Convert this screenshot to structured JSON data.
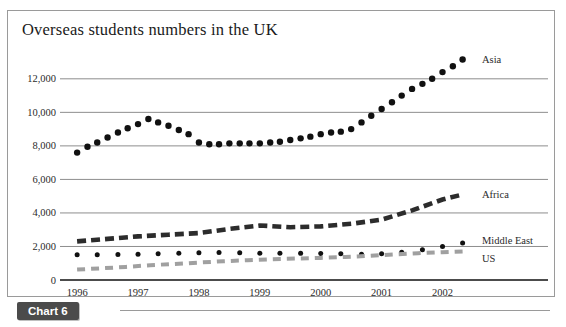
{
  "figure": {
    "title": "Overseas students numbers in the UK",
    "badge_label": "Chart 6"
  },
  "chart_data": {
    "type": "line",
    "title": "Overseas students numbers in the UK",
    "xlabel": "",
    "ylabel": "",
    "x": [
      1996,
      1997,
      1998,
      1999,
      2000,
      2001,
      2002
    ],
    "categories": [
      "1996",
      "1997",
      "1998",
      "1999",
      "2000",
      "2001",
      "2002"
    ],
    "xlim": [
      1995.85,
      2002.55
    ],
    "ylim": [
      0,
      13600
    ],
    "yticks": [
      0,
      2000,
      4000,
      6000,
      8000,
      10000,
      12000
    ],
    "ytick_labels": [
      "0",
      "2,000",
      "4,000",
      "6,000",
      "8,000",
      "10,000",
      "12,000"
    ],
    "grid": "horizontal",
    "legend": "right-inline",
    "series": [
      {
        "name": "Asia",
        "style": "dotted",
        "color": "#111111",
        "label": "Asia",
        "x": [
          1996.0,
          1996.17,
          1996.33,
          1996.5,
          1996.67,
          1996.83,
          1997.0,
          1997.17,
          1997.33,
          1997.5,
          1997.67,
          1997.83,
          1998.0,
          1998.17,
          1998.33,
          1998.5,
          1998.67,
          1998.83,
          1999.0,
          1999.17,
          1999.33,
          1999.5,
          1999.67,
          1999.83,
          2000.0,
          2000.17,
          2000.33,
          2000.5,
          2000.67,
          2000.83,
          2001.0,
          2001.17,
          2001.33,
          2001.5,
          2001.67,
          2001.83,
          2002.0,
          2002.17,
          2002.33
        ],
        "values": [
          7600,
          7950,
          8200,
          8500,
          8800,
          9050,
          9300,
          9600,
          9400,
          9200,
          8950,
          8700,
          8200,
          8100,
          8100,
          8150,
          8150,
          8150,
          8150,
          8200,
          8250,
          8350,
          8450,
          8550,
          8700,
          8800,
          8850,
          9000,
          9400,
          9800,
          10200,
          10600,
          11000,
          11400,
          11700,
          12000,
          12400,
          12750,
          13150
        ]
      },
      {
        "name": "Africa",
        "style": "dashed-thick",
        "color": "#2c2c2c",
        "label": "Africa",
        "x": [
          1996.0,
          1996.5,
          1997.0,
          1997.5,
          1998.0,
          1998.5,
          1999.0,
          1999.5,
          2000.0,
          2000.5,
          2001.0,
          2001.5,
          2002.0,
          2002.33
        ],
        "values": [
          2300,
          2450,
          2600,
          2700,
          2800,
          3050,
          3250,
          3150,
          3200,
          3350,
          3600,
          4150,
          4800,
          5100
        ]
      },
      {
        "name": "Middle East",
        "style": "dotted",
        "color": "#111111",
        "label": "Middle East",
        "x": [
          1996.0,
          1996.33,
          1996.67,
          1997.0,
          1997.33,
          1997.67,
          1998.0,
          1998.33,
          1998.67,
          1999.0,
          1999.33,
          1999.67,
          2000.0,
          2000.33,
          2000.67,
          2001.0,
          2001.33,
          2001.67,
          2002.0,
          2002.33
        ],
        "values": [
          1500,
          1500,
          1520,
          1540,
          1560,
          1600,
          1620,
          1640,
          1620,
          1600,
          1600,
          1590,
          1580,
          1560,
          1540,
          1560,
          1650,
          1800,
          2000,
          2200
        ]
      },
      {
        "name": "US",
        "style": "dashed-grey",
        "color": "#a0a0a0",
        "label": "US",
        "x": [
          1996.0,
          1996.4,
          1996.8,
          1997.2,
          1997.6,
          1998.0,
          1998.4,
          1998.8,
          1999.2,
          1999.6,
          2000.0,
          2000.4,
          2000.8,
          2001.2,
          2001.6,
          2002.0,
          2002.33
        ],
        "values": [
          620,
          700,
          780,
          880,
          960,
          1040,
          1120,
          1180,
          1240,
          1280,
          1320,
          1380,
          1440,
          1520,
          1600,
          1660,
          1700
        ]
      }
    ]
  },
  "colors": {
    "grid": "#8d8d8d",
    "axis": "#111111",
    "frame": "#9a9a9a",
    "badge_bg": "#4b4b4b",
    "asia": "#111111",
    "africa": "#2c2c2c",
    "middle_east": "#111111",
    "us": "#a0a0a0"
  }
}
